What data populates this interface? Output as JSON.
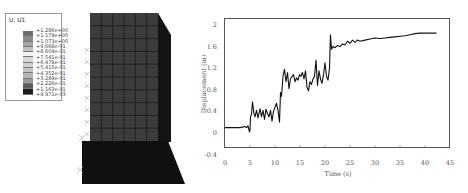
{
  "fe_model": {
    "legend": {
      "title": "U, U1",
      "values": [
        "+1.286e+00",
        "+1.179e+00",
        "+1.073e+00",
        "+9.668e-01",
        "+8.604e-01",
        "+7.541e-01",
        "+6.478e-01",
        "+5.415e-01",
        "+4.352e-01",
        "+3.289e-01",
        "+2.226e-01",
        "+1.163e-01",
        "+9.971e-03"
      ],
      "bin_colors": [
        "#6e6e6e",
        "#8a8a8a",
        "#a4a4a4",
        "#c0c0c0",
        "#f2f2f2",
        "#d9d9d9",
        "#cfcfcf",
        "#c4c4c4",
        "#b4b4b4",
        "#9a9a9a",
        "#5a5a5a",
        "#1e1e1e"
      ]
    },
    "colors": {
      "front_face": "#3c3c3c",
      "side_face": "#141414",
      "base": "#101010",
      "grid": "#1a1a1a"
    }
  },
  "chart_data": {
    "type": "line",
    "title": "",
    "xlabel": "Time (s)",
    "ylabel": "Displacement (m)",
    "xlim": [
      0,
      45
    ],
    "ylim": [
      -0.4,
      2.0
    ],
    "xticks": [
      0,
      5,
      10,
      15,
      20,
      25,
      30,
      35,
      40,
      45
    ],
    "yticks": [
      -0.4,
      0,
      0.4,
      0.8,
      1.2,
      1.6,
      2
    ],
    "ytick_labels": [
      "-0.4",
      "0",
      "0.4",
      "0.8",
      "1.2",
      "1.6",
      "2"
    ],
    "grid": false,
    "series": [
      {
        "name": "Displacement",
        "x": [
          0,
          1,
          2,
          3,
          3.5,
          4,
          4.3,
          4.6,
          4.9,
          5.0,
          5.1,
          5.3,
          5.5,
          5.8,
          6.0,
          6.3,
          6.6,
          7.0,
          7.3,
          7.6,
          7.9,
          8.2,
          8.5,
          8.8,
          9.1,
          9.4,
          9.7,
          10.0,
          10.3,
          10.6,
          10.9,
          11.1,
          11.3,
          11.6,
          11.9,
          12.2,
          12.5,
          12.8,
          13.1,
          13.4,
          13.7,
          14.0,
          14.3,
          14.6,
          14.9,
          15.2,
          15.5,
          15.8,
          16.1,
          16.4,
          16.7,
          17.0,
          17.3,
          17.6,
          17.9,
          18.2,
          18.5,
          18.8,
          19.1,
          19.4,
          19.7,
          20.0,
          20.3,
          20.6,
          20.9,
          21.1,
          21.3,
          21.6,
          22.0,
          22.5,
          23,
          23.5,
          24,
          24.5,
          25,
          25.5,
          26,
          26.5,
          27,
          28,
          29,
          30,
          31,
          32,
          33,
          34,
          35,
          36,
          37,
          38,
          39,
          40,
          41,
          42.3
        ],
        "values": [
          0.1,
          0.1,
          0.1,
          0.1,
          0.11,
          0.12,
          0.1,
          0.13,
          0.02,
          0.05,
          0.3,
          0.35,
          0.58,
          0.35,
          0.3,
          0.42,
          0.28,
          0.45,
          0.3,
          0.42,
          0.25,
          0.44,
          0.36,
          0.3,
          0.42,
          0.22,
          0.4,
          0.48,
          0.55,
          0.42,
          0.2,
          0.75,
          0.68,
          1.05,
          1.18,
          0.95,
          1.12,
          0.82,
          1.0,
          1.05,
          1.08,
          0.95,
          1.02,
          0.98,
          1.08,
          1.05,
          1.12,
          1.0,
          1.15,
          0.85,
          0.78,
          0.95,
          0.9,
          1.0,
          1.05,
          1.35,
          0.88,
          1.15,
          1.0,
          0.92,
          1.08,
          1.3,
          1.05,
          0.98,
          1.2,
          1.82,
          1.55,
          1.6,
          1.58,
          1.62,
          1.6,
          1.65,
          1.63,
          1.7,
          1.66,
          1.72,
          1.68,
          1.72,
          1.7,
          1.72,
          1.74,
          1.76,
          1.75,
          1.76,
          1.77,
          1.78,
          1.79,
          1.8,
          1.82,
          1.84,
          1.85,
          1.85,
          1.85,
          1.85
        ]
      }
    ]
  }
}
